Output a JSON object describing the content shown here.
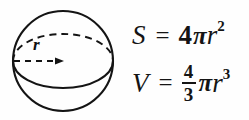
{
  "figure": {
    "shape_name": "sphere",
    "radius_label": "r",
    "stroke_color": "#141414",
    "background_color": "#fefefe",
    "circle": {
      "cx": 63,
      "cy": 61,
      "r": 50
    },
    "equator_ellipse": {
      "cx": 63,
      "cy": 61,
      "rx": 50,
      "ry": 27
    },
    "radius_arrow": {
      "x1": 14,
      "y1": 61,
      "x2": 63,
      "y2": 61
    }
  },
  "formulas": {
    "surface_area": {
      "variable": "S",
      "equals": "=",
      "coefficient": "4",
      "pi": "π",
      "radius": "r",
      "exponent": "2",
      "full_text": "S = 4πr²"
    },
    "volume": {
      "variable": "V",
      "equals": "=",
      "fraction_numerator": "4",
      "fraction_denominator": "3",
      "pi": "π",
      "radius": "r",
      "exponent": "3",
      "full_text": "V = 4/3 πr³"
    }
  }
}
